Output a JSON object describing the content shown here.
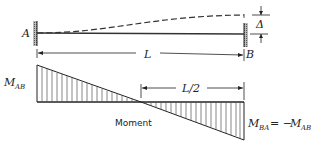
{
  "diagram": {
    "type": "beam with end displacement and moment diagram",
    "labels": {
      "end_a": "A",
      "end_b": "B",
      "span": "L",
      "displacement": "Δ",
      "half_span": "L/2",
      "moment_caption": "Moment",
      "m_ab_main": "M",
      "m_ab_sub": "AB",
      "m_ba_main": "M",
      "m_ba_sub": "BA",
      "m_ba_equals": "= −",
      "m_ba_rhs_main": "M",
      "m_ba_rhs_sub": "AB"
    },
    "colors": {
      "line": "#222222",
      "hatch": "#555555",
      "background": "#ffffff"
    }
  }
}
